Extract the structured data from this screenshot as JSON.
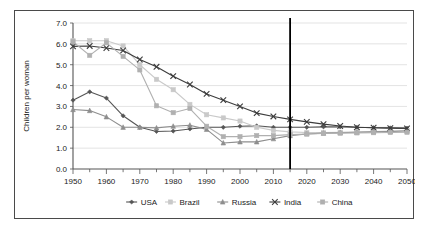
{
  "chart_data": {
    "type": "line",
    "title": "",
    "xlabel": "",
    "ylabel": "Children per woman",
    "xlim": [
      1950,
      2050
    ],
    "ylim": [
      0.0,
      7.0
    ],
    "ytick_step": 1.0,
    "xtick_step": 10,
    "xminor_step": 5,
    "grid": true,
    "grid_axis": "y",
    "legend_position": "bottom",
    "x": [
      1950,
      1955,
      1960,
      1965,
      1970,
      1975,
      1980,
      1985,
      1990,
      1995,
      2000,
      2005,
      2010,
      2015,
      2020,
      2025,
      2030,
      2035,
      2040,
      2045,
      2050
    ],
    "xtick_labels": [
      "1950",
      "1960",
      "1970",
      "1980",
      "1990",
      "2000",
      "2010",
      "2020",
      "2030",
      "2040",
      "2050"
    ],
    "ytick_labels": [
      "0.0",
      "1.0",
      "2.0",
      "3.0",
      "4.0",
      "5.0",
      "6.0",
      "7.0"
    ],
    "annotations": [
      {
        "type": "vline",
        "x": 2015,
        "label": "",
        "color": "#000000"
      }
    ],
    "series": [
      {
        "name": "USA",
        "marker": "diamond",
        "color": "#555555",
        "values": [
          3.3,
          3.7,
          3.4,
          2.55,
          2.0,
          1.8,
          1.82,
          1.92,
          2.0,
          2.0,
          2.05,
          2.07,
          2.0,
          2.0,
          2.0,
          2.02,
          2.02,
          2.0,
          1.98,
          1.97,
          1.96
        ]
      },
      {
        "name": "Brazil",
        "marker": "square",
        "color": "#c9c9c9",
        "values": [
          6.15,
          6.15,
          6.15,
          5.9,
          5.0,
          4.3,
          3.8,
          3.1,
          2.6,
          2.45,
          2.3,
          2.0,
          1.85,
          1.78,
          1.75,
          1.75,
          1.76,
          1.78,
          1.8,
          1.82,
          1.85
        ]
      },
      {
        "name": "Russia",
        "marker": "triangle",
        "color": "#8e8e8e",
        "values": [
          2.85,
          2.8,
          2.5,
          2.0,
          2.0,
          1.97,
          2.05,
          2.1,
          1.9,
          1.25,
          1.3,
          1.3,
          1.45,
          1.6,
          1.68,
          1.72,
          1.74,
          1.76,
          1.78,
          1.8,
          1.82
        ]
      },
      {
        "name": "India",
        "marker": "x",
        "color": "#3c3c3c",
        "values": [
          5.88,
          5.9,
          5.8,
          5.68,
          5.25,
          4.9,
          4.45,
          4.05,
          3.6,
          3.3,
          3.0,
          2.68,
          2.52,
          2.38,
          2.26,
          2.15,
          2.06,
          2.0,
          1.98,
          1.96,
          1.95
        ]
      },
      {
        "name": "China",
        "marker": "square",
        "color": "#b0b0b0",
        "values": [
          6.1,
          5.45,
          6.05,
          5.4,
          4.75,
          3.03,
          2.7,
          2.9,
          2.05,
          1.55,
          1.55,
          1.6,
          1.6,
          1.65,
          1.68,
          1.7,
          1.72,
          1.73,
          1.74,
          1.75,
          1.76
        ]
      }
    ]
  },
  "legend": {
    "items": [
      {
        "label": "USA"
      },
      {
        "label": "Brazil"
      },
      {
        "label": "Russia"
      },
      {
        "label": "India"
      },
      {
        "label": "China"
      }
    ]
  }
}
